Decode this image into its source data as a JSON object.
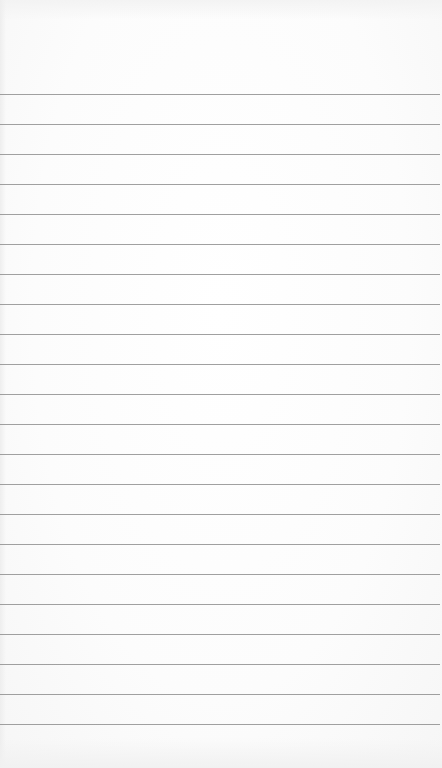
{
  "scene": {
    "subject": "blank lined notepad page",
    "paper_color": "#fdfdfd",
    "rule_color": "#8f8f8f"
  },
  "rules": {
    "count": 22,
    "first_y": 94,
    "spacing": 30,
    "positions": [
      94,
      124,
      154,
      184,
      214,
      244,
      274,
      304,
      334,
      364,
      394,
      424,
      454,
      484,
      514,
      544,
      574,
      604,
      634,
      664,
      694,
      724
    ]
  }
}
